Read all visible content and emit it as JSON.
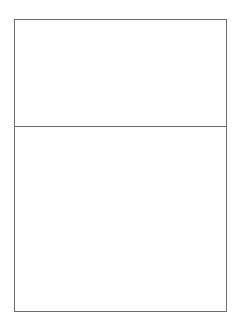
{
  "diagram": {
    "sphere_color": "#9a9a9a",
    "frame_color": "#6b6b6b",
    "top_panel": {
      "spheres": [
        {
          "x": 83,
          "y": 57
        },
        {
          "x": 109,
          "y": 57
        },
        {
          "x": 135,
          "y": 57
        }
      ]
    },
    "options": [
      {
        "label": "A",
        "label_pos": {
          "x": 30,
          "y": 163
        },
        "spheres": [
          {
            "x": 62,
            "y": 153
          },
          {
            "x": 51,
            "y": 163
          },
          {
            "x": 43,
            "y": 174
          }
        ]
      },
      {
        "label": "B",
        "label_pos": {
          "x": 132,
          "y": 163
        },
        "spheres": [
          {
            "x": 149,
            "y": 155
          },
          {
            "x": 186,
            "y": 156
          },
          {
            "x": 149,
            "y": 194
          }
        ]
      },
      {
        "label": "C",
        "label_pos": {
          "x": 29,
          "y": 244
        },
        "spheres": [
          {
            "x": 64,
            "y": 238
          },
          {
            "x": 54,
            "y": 247
          },
          {
            "x": 44,
            "y": 257
          }
        ]
      },
      {
        "label": "D",
        "label_pos": {
          "x": 131,
          "y": 244
        },
        "spheres": [
          {
            "x": 159,
            "y": 251
          }
        ]
      }
    ]
  }
}
